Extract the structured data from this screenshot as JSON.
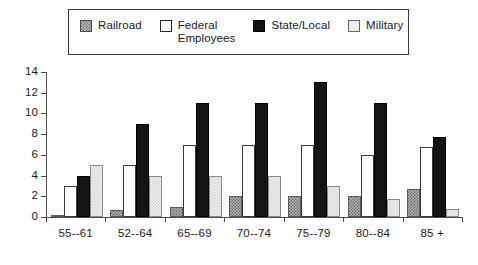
{
  "chart_data": {
    "type": "bar",
    "title": "",
    "xlabel": "",
    "ylabel": "",
    "categories": [
      "55--61",
      "52--64",
      "65--69",
      "70--74",
      "75--79",
      "80--84",
      "85 +"
    ],
    "series": [
      {
        "name": "Railroad",
        "swatch": "railroad",
        "values": [
          0.2,
          0.7,
          1.0,
          2.0,
          2.0,
          2.0,
          2.7
        ]
      },
      {
        "name": "Federal\nEmployees",
        "swatch": "federal",
        "values": [
          3.0,
          5.0,
          7.0,
          7.0,
          7.0,
          6.0,
          6.8
        ]
      },
      {
        "name": "State/Local",
        "swatch": "state",
        "values": [
          4.0,
          9.0,
          11.0,
          11.0,
          13.0,
          11.0,
          7.7
        ]
      },
      {
        "name": "Military",
        "swatch": "military",
        "values": [
          5.0,
          4.0,
          4.0,
          4.0,
          3.0,
          1.7,
          0.8
        ]
      }
    ],
    "ylim": [
      0,
      14
    ],
    "yticks": [
      0,
      2,
      4,
      6,
      8,
      10,
      12,
      14
    ],
    "ytick_labels": [
      "0",
      "2",
      "4",
      "6",
      "8",
      "10",
      "12",
      "14"
    ],
    "grid": false,
    "legend_position": "top",
    "colors": {
      "railroad": "#b5b5b5",
      "federal": "#ffffff",
      "state": "#141414",
      "military": "#efefef",
      "axis": "#4d4d4d",
      "text": "#1a1a1a",
      "legend_border": "#3a3a3a"
    }
  },
  "legend": {
    "entries": [
      {
        "label": "Railroad"
      },
      {
        "label": "Federal\nEmployees"
      },
      {
        "label": "State/Local"
      },
      {
        "label": "Military"
      }
    ]
  }
}
